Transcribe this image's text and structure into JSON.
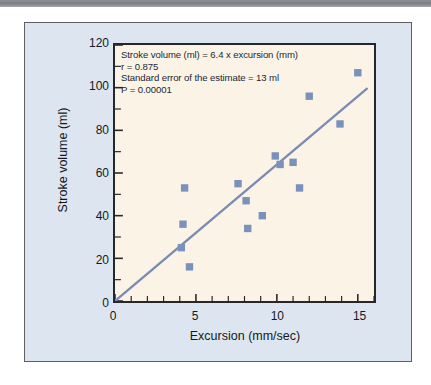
{
  "figure": {
    "background_color": "#dde6f0",
    "plot_fill_color": "#fbf4e6",
    "marker_color": "#7a92bb",
    "line_color": "#7a8cb4",
    "axis_color": "#26272b"
  },
  "annotation": {
    "line1": "Stroke volume (ml) = 6.4 x excursion (mm)",
    "line2": "r = 0.875",
    "line3": "Standard error of the estimate = 13 ml",
    "line4": "P = 0.00001"
  },
  "chart_data": {
    "type": "scatter",
    "title": "",
    "xlabel": "Excursion (mm/sec)",
    "ylabel": "Stroke volume (ml)",
    "xlim": [
      0,
      16
    ],
    "ylim": [
      0,
      120
    ],
    "xticks": [
      0,
      5,
      10,
      15
    ],
    "xtick_labels": [
      "0",
      "5",
      "10",
      "15"
    ],
    "xminor_step": 1,
    "yticks": [
      0,
      20,
      40,
      60,
      80,
      100,
      120
    ],
    "ytick_labels": [
      "0",
      "20",
      "40",
      "60",
      "80",
      "100",
      "120"
    ],
    "yminor_step": 10,
    "grid": false,
    "legend": "none",
    "points": [
      {
        "x": 4.1,
        "y": 25
      },
      {
        "x": 4.2,
        "y": 36
      },
      {
        "x": 4.3,
        "y": 53
      },
      {
        "x": 4.6,
        "y": 16
      },
      {
        "x": 7.6,
        "y": 55
      },
      {
        "x": 8.1,
        "y": 47
      },
      {
        "x": 8.2,
        "y": 34
      },
      {
        "x": 9.1,
        "y": 40
      },
      {
        "x": 9.9,
        "y": 68
      },
      {
        "x": 10.2,
        "y": 64
      },
      {
        "x": 11.0,
        "y": 65
      },
      {
        "x": 11.4,
        "y": 53
      },
      {
        "x": 12.0,
        "y": 96
      },
      {
        "x": 13.9,
        "y": 83
      },
      {
        "x": 15.0,
        "y": 107
      }
    ],
    "fit_line": {
      "label": "regression line",
      "slope": 6.4,
      "intercept": 0,
      "x_start": 0,
      "y_start": 0,
      "x_end": 15.6,
      "y_end": 99.8
    },
    "statistics": {
      "equation": "Stroke volume (ml) = 6.4 x excursion (mm)",
      "r": 0.875,
      "standard_error_of_estimate": "13 ml",
      "p_value": "0.00001"
    }
  }
}
